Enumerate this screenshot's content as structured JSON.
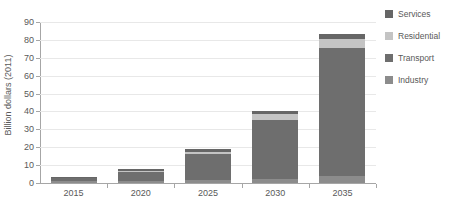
{
  "chart_data": {
    "type": "bar",
    "stacked": true,
    "title": "",
    "xlabel": "",
    "ylabel": "Billion dollars (2011)",
    "categories": [
      "2015",
      "2020",
      "2025",
      "2030",
      "2035"
    ],
    "ylim": [
      0,
      90
    ],
    "ytick_step": 10,
    "yticks": [
      "90",
      "80",
      "70",
      "60",
      "50",
      "40",
      "30",
      "20",
      "10",
      "0"
    ],
    "grid": true,
    "legend_position": "top-right",
    "stack_order_top_to_bottom": [
      "Services",
      "Residential",
      "Transport",
      "Industry"
    ],
    "series": [
      {
        "name": "Industry",
        "color": "#8c8c8c",
        "values": [
          1.0,
          1.2,
          1.5,
          2.0,
          4.0
        ]
      },
      {
        "name": "Transport",
        "color": "#6e6e6e",
        "values": [
          1.6,
          4.8,
          14.5,
          33.5,
          71.5
        ]
      },
      {
        "name": "Residential",
        "color": "#c4c4c4",
        "values": [
          0.3,
          1.0,
          1.5,
          3.0,
          5.0
        ]
      },
      {
        "name": "Services",
        "color": "#666666",
        "values": [
          0.3,
          1.0,
          1.5,
          2.0,
          3.0
        ]
      }
    ],
    "totals": [
      3.2,
      8.0,
      19.0,
      40.5,
      83.5
    ]
  },
  "legend": {
    "items": [
      {
        "label": "Services",
        "color": "#666666"
      },
      {
        "label": "Residential",
        "color": "#c4c4c4"
      },
      {
        "label": "Transport",
        "color": "#6e6e6e"
      },
      {
        "label": "Industry",
        "color": "#8c8c8c"
      }
    ]
  },
  "axes": {
    "y_title": "Billion dollars (2011)"
  }
}
